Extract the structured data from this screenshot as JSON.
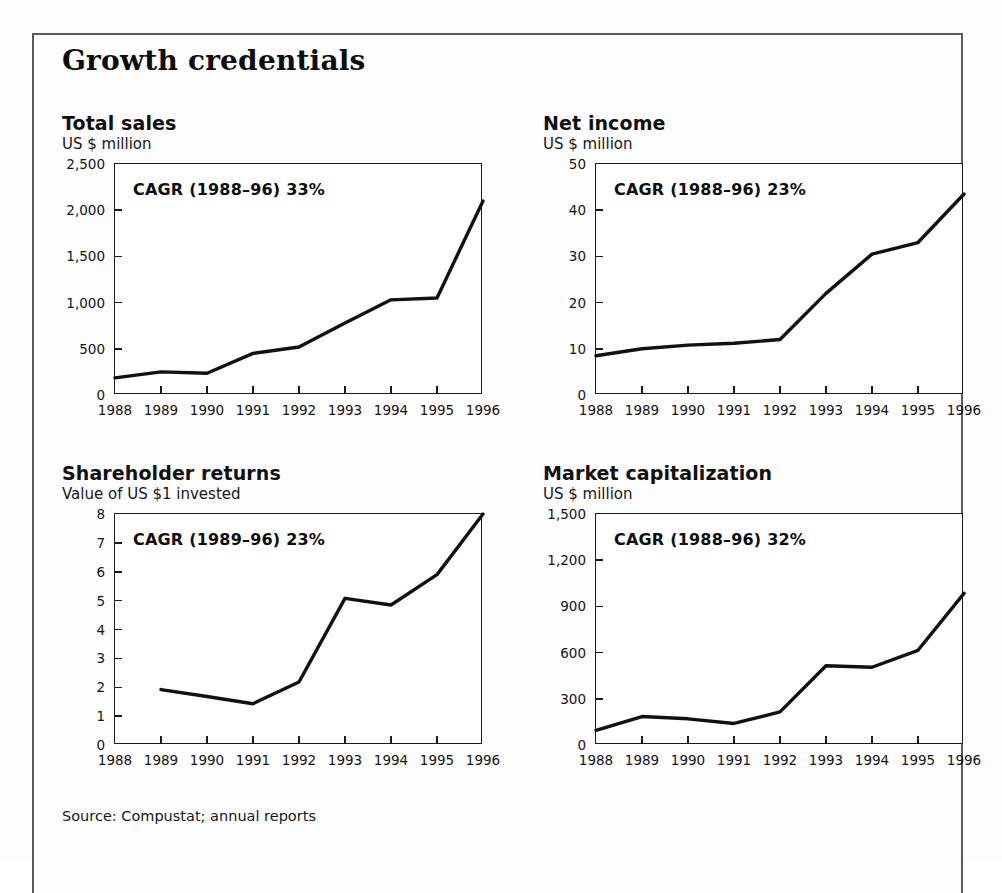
{
  "exhibit": {
    "title": "Growth credentials",
    "source_note": "Source: Compustat; annual reports"
  },
  "charts": [
    {
      "key": "total_sales",
      "title": "Total sales",
      "subtitle": "US $ million",
      "cagr_label": "CAGR (1988–96) 33%"
    },
    {
      "key": "net_income",
      "title": "Net income",
      "subtitle": "US $ million",
      "cagr_label": "CAGR (1988–96) 23%"
    },
    {
      "key": "shareholder_returns",
      "title": "Shareholder returns",
      "subtitle": "Value of US $1 invested",
      "cagr_label": "CAGR (1989–96) 23%"
    },
    {
      "key": "market_capitalization",
      "title": "Market capitalization",
      "subtitle": "US $ million",
      "cagr_label": "CAGR (1988–96) 32%"
    }
  ],
  "chart_data": [
    {
      "type": "line",
      "key": "total_sales",
      "title": "Total sales",
      "subtitle": "US $ million",
      "xlabel": "",
      "ylabel": "US $ million",
      "annotation": "CAGR (1988–96) 33%",
      "grid": false,
      "legend": "none",
      "categories": [
        "1988",
        "1989",
        "1990",
        "1991",
        "1992",
        "1993",
        "1994",
        "1995",
        "1996"
      ],
      "x": [
        1988,
        1989,
        1990,
        1991,
        1992,
        1993,
        1994,
        1995,
        1996
      ],
      "values": [
        185,
        250,
        235,
        450,
        520,
        780,
        1030,
        1050,
        2100
      ],
      "ylim": [
        0,
        2500
      ],
      "yticks": [
        0,
        500,
        1000,
        1500,
        2000,
        2500
      ],
      "ytick_labels": [
        "0",
        "500",
        "1,000",
        "1,500",
        "2,000",
        "2,500"
      ],
      "xlim": [
        1988,
        1996
      ],
      "xticks": [
        1988,
        1989,
        1990,
        1991,
        1992,
        1993,
        1994,
        1995,
        1996
      ],
      "xtick_labels": [
        "1988",
        "1989",
        "1990",
        "1991",
        "1992",
        "1993",
        "1994",
        "1995",
        "1996"
      ],
      "line_color": "#111111"
    },
    {
      "type": "line",
      "key": "net_income",
      "title": "Net income",
      "subtitle": "US $ million",
      "xlabel": "",
      "ylabel": "US $ million",
      "annotation": "CAGR (1988–96) 23%",
      "grid": false,
      "legend": "none",
      "categories": [
        "1988",
        "1989",
        "1990",
        "1991",
        "1992",
        "1993",
        "1994",
        "1995",
        "1996"
      ],
      "x": [
        1988,
        1989,
        1990,
        1991,
        1992,
        1993,
        1994,
        1995,
        1996
      ],
      "values": [
        8.5,
        10.0,
        10.8,
        11.2,
        12.0,
        22.0,
        30.5,
        33.0,
        43.5
      ],
      "ylim": [
        0,
        50
      ],
      "yticks": [
        0,
        10,
        20,
        30,
        40,
        50
      ],
      "ytick_labels": [
        "0",
        "10",
        "20",
        "30",
        "40",
        "50"
      ],
      "xlim": [
        1988,
        1996
      ],
      "xticks": [
        1988,
        1989,
        1990,
        1991,
        1992,
        1993,
        1994,
        1995,
        1996
      ],
      "xtick_labels": [
        "1988",
        "1989",
        "1990",
        "1991",
        "1992",
        "1993",
        "1994",
        "1995",
        "1996"
      ],
      "line_color": "#111111"
    },
    {
      "type": "line",
      "key": "shareholder_returns",
      "title": "Shareholder returns",
      "subtitle": "Value of US $1 invested",
      "xlabel": "",
      "ylabel": "Value of US $1 invested",
      "annotation": "CAGR (1989–96) 23%",
      "grid": false,
      "legend": "none",
      "categories": [
        "1988",
        "1989",
        "1990",
        "1991",
        "1992",
        "1993",
        "1994",
        "1995",
        "1996"
      ],
      "x": [
        1989,
        1990,
        1991,
        1992,
        1993,
        1994,
        1995,
        1996
      ],
      "values": [
        1.92,
        1.68,
        1.43,
        2.18,
        5.08,
        4.85,
        5.9,
        8.0
      ],
      "ylim": [
        0,
        8
      ],
      "yticks": [
        0,
        1,
        2,
        3,
        4,
        5,
        6,
        7,
        8
      ],
      "ytick_labels": [
        "0",
        "1",
        "2",
        "3",
        "4",
        "5",
        "6",
        "7",
        "8"
      ],
      "xlim": [
        1988,
        1996
      ],
      "xticks": [
        1988,
        1989,
        1990,
        1991,
        1992,
        1993,
        1994,
        1995,
        1996
      ],
      "xtick_labels": [
        "1988",
        "1989",
        "1990",
        "1991",
        "1992",
        "1993",
        "1994",
        "1995",
        "1996"
      ],
      "line_color": "#111111"
    },
    {
      "type": "line",
      "key": "market_capitalization",
      "title": "Market capitalization",
      "subtitle": "US $ million",
      "xlabel": "",
      "ylabel": "US $ million",
      "annotation": "CAGR (1988–96) 32%",
      "grid": false,
      "legend": "none",
      "categories": [
        "1988",
        "1989",
        "1990",
        "1991",
        "1992",
        "1993",
        "1994",
        "1995",
        "1996"
      ],
      "x": [
        1988,
        1989,
        1990,
        1991,
        1992,
        1993,
        1994,
        1995,
        1996
      ],
      "values": [
        95,
        185,
        170,
        140,
        215,
        515,
        505,
        615,
        985
      ],
      "ylim": [
        0,
        1500
      ],
      "yticks": [
        0,
        300,
        600,
        900,
        1200,
        1500
      ],
      "ytick_labels": [
        "0",
        "300",
        "600",
        "900",
        "1,200",
        "1,500"
      ],
      "xlim": [
        1988,
        1996
      ],
      "xticks": [
        1988,
        1989,
        1990,
        1991,
        1992,
        1993,
        1994,
        1995,
        1996
      ],
      "xtick_labels": [
        "1988",
        "1989",
        "1990",
        "1991",
        "1992",
        "1993",
        "1994",
        "1995",
        "1996"
      ],
      "line_color": "#111111"
    }
  ]
}
